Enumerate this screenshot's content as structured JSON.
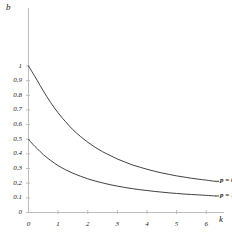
{
  "chart_data": {
    "type": "line",
    "title": "",
    "xlabel": "k",
    "ylabel": "b",
    "xlim": [
      0,
      6.6
    ],
    "ylim": [
      0,
      1.05
    ],
    "grid": false,
    "legend_position": "inline-right-of-curve-ends",
    "x_ticks": [
      "0",
      "1",
      "2",
      "3",
      "4",
      "5",
      "6"
    ],
    "x_tick_values": [
      0,
      1,
      2,
      3,
      4,
      5,
      6
    ],
    "y_ticks": [
      "0",
      "0.1",
      "0.2",
      "0.3",
      "0.4",
      "0.5",
      "0.6",
      "0.7",
      "0.8",
      "0.9",
      "1"
    ],
    "y_tick_values": [
      0,
      0.1,
      0.2,
      0.3,
      0.4,
      0.5,
      0.6,
      0.7,
      0.8,
      0.9,
      1
    ],
    "series": [
      {
        "name": "p = 0",
        "label": "p = 0",
        "annotation": "p = 0",
        "color": "#2b2b2b",
        "x": [
          0,
          0.15,
          0.3,
          0.5,
          0.75,
          1.0,
          1.25,
          1.5,
          1.75,
          2.0,
          2.25,
          2.5,
          2.75,
          3.0,
          3.25,
          3.5,
          3.75,
          4.0,
          4.25,
          4.5,
          4.75,
          5.0,
          5.25,
          5.5,
          5.75,
          6.0,
          6.3
        ],
        "values": [
          1.0,
          0.95,
          0.9,
          0.83,
          0.75,
          0.68,
          0.62,
          0.565,
          0.52,
          0.48,
          0.445,
          0.415,
          0.39,
          0.365,
          0.345,
          0.325,
          0.31,
          0.295,
          0.282,
          0.27,
          0.26,
          0.25,
          0.242,
          0.234,
          0.227,
          0.221,
          0.213
        ]
      },
      {
        "name": "p = 1",
        "label": "p = 1",
        "annotation": "p = 1",
        "color": "#2b2b2b",
        "x": [
          0,
          0.15,
          0.3,
          0.5,
          0.75,
          1.0,
          1.25,
          1.5,
          1.75,
          2.0,
          2.25,
          2.5,
          2.75,
          3.0,
          3.25,
          3.5,
          3.75,
          4.0,
          4.25,
          4.5,
          4.75,
          5.0,
          5.25,
          5.5,
          5.75,
          6.0,
          6.3
        ],
        "values": [
          0.5,
          0.465,
          0.435,
          0.395,
          0.355,
          0.32,
          0.292,
          0.268,
          0.248,
          0.23,
          0.215,
          0.202,
          0.19,
          0.18,
          0.171,
          0.163,
          0.156,
          0.15,
          0.144,
          0.139,
          0.134,
          0.13,
          0.126,
          0.123,
          0.12,
          0.117,
          0.113
        ]
      }
    ]
  },
  "style": {
    "axis_color": "#b8b8b8",
    "curve_color": "#2b2b2b",
    "text_color": "#1a1a1a",
    "background": "#ffffff"
  }
}
